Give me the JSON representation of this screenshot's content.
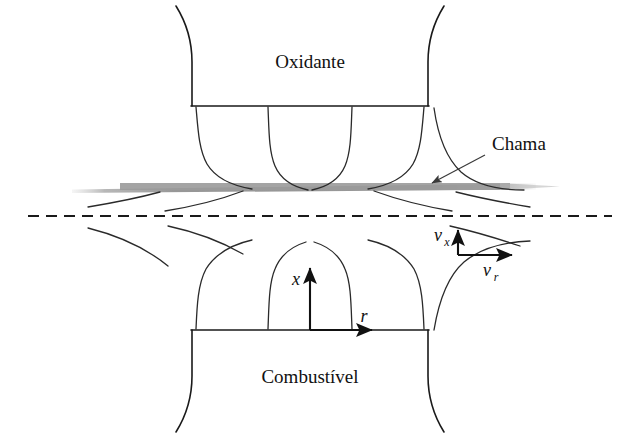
{
  "figure": {
    "title_text": "",
    "background_color": "#ffffff",
    "width": 626,
    "height": 439,
    "stroke_color": "#1a1a1a",
    "flame_color": "#9a9a9a"
  },
  "labels": {
    "oxidizer": "Oxidante",
    "fuel": "Combustível",
    "flame": "Chama",
    "axis_x": "x",
    "axis_r": "r",
    "velocity_x_base": "v",
    "velocity_x_sub": "x",
    "velocity_r_base": "v",
    "velocity_r_sub": "r"
  },
  "geometry": {
    "oxidizer_nozzle_exit_y": 106,
    "fuel_nozzle_exit_y": 330,
    "nozzle_left_x": 192,
    "nozzle_right_x": 428,
    "flame_band_y": 186,
    "flame_band_left_x": 72,
    "flame_band_right_x": 536,
    "centerline_y": 216,
    "centerline_left_x": 28,
    "centerline_right_x": 612,
    "axis_origin_x": 310,
    "velocity_origin_x": 458,
    "velocity_origin_y": 255
  }
}
